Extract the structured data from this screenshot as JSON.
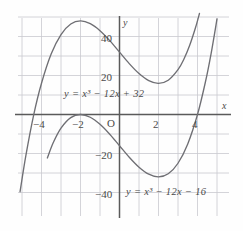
{
  "figure": {
    "type": "cartesian-graph",
    "axis_labels": {
      "x": "x",
      "y": "y",
      "origin": "O"
    },
    "x_ticks": [
      {
        "value": -4,
        "label": "−4"
      },
      {
        "value": -2,
        "label": "−2"
      },
      {
        "value": 2,
        "label": "2"
      },
      {
        "value": 4,
        "label": "4"
      }
    ],
    "y_ticks": [
      {
        "value": 40,
        "label": "40"
      },
      {
        "value": 20,
        "label": "20"
      },
      {
        "value": -20,
        "label": "−20"
      },
      {
        "value": -40,
        "label": "−40"
      }
    ],
    "curve_labels": {
      "upper": "y = x³ − 12x + 32",
      "lower": "y = x³ − 12x − 16"
    },
    "colors": {
      "grid": "#c9c9cf",
      "axis": "#5a5a5a",
      "curve": "#6f6f74",
      "text": "#4a4a4a",
      "background": "#fefefe"
    }
  },
  "chart_data": {
    "type": "line",
    "title": "",
    "xlabel": "x",
    "ylabel": "y",
    "xlim": [
      -5.2,
      5.6
    ],
    "ylim": [
      -49,
      50
    ],
    "grid": true,
    "legend": "inline-annotations",
    "x_ticks": [
      -4,
      -2,
      2,
      4
    ],
    "y_ticks": [
      40,
      20,
      -20,
      -40
    ],
    "x_gridline_step": 1,
    "y_gridline_step": 10,
    "series": [
      {
        "name": "y = x³ − 12x + 32",
        "equation": "x^3 - 12x + 32",
        "roots": [
          -4,
          2
        ],
        "local_max": {
          "x": -2,
          "y": 48
        },
        "local_min": {
          "x": 2,
          "y": 16
        },
        "points": [
          {
            "x": -5.1,
            "y": -39.6
          },
          {
            "x": -4.8,
            "y": -21.0
          },
          {
            "x": -4.4,
            "y": -0.2
          },
          {
            "x": -4.0,
            "y": 16.0
          },
          {
            "x": -3.5,
            "y": 31.1
          },
          {
            "x": -3.0,
            "y": 41.0
          },
          {
            "x": -2.5,
            "y": 46.4
          },
          {
            "x": -2.0,
            "y": 48.0
          },
          {
            "x": -1.5,
            "y": 46.6
          },
          {
            "x": -1.0,
            "y": 43.0
          },
          {
            "x": -0.5,
            "y": 37.9
          },
          {
            "x": 0.0,
            "y": 32.0
          },
          {
            "x": 0.5,
            "y": 26.1
          },
          {
            "x": 1.0,
            "y": 21.0
          },
          {
            "x": 1.5,
            "y": 17.4
          },
          {
            "x": 2.0,
            "y": 16.0
          },
          {
            "x": 2.5,
            "y": 17.6
          },
          {
            "x": 3.0,
            "y": 23.0
          },
          {
            "x": 3.3,
            "y": 28.3
          },
          {
            "x": 3.6,
            "y": 35.5
          },
          {
            "x": 3.9,
            "y": 44.6
          },
          {
            "x": 4.1,
            "y": 51.8
          }
        ]
      },
      {
        "name": "y = x³ − 12x − 16",
        "equation": "x^3 - 12x - 16",
        "roots": [
          -2,
          4
        ],
        "local_max": {
          "x": -2,
          "y": 0
        },
        "local_min": {
          "x": 2,
          "y": -32
        },
        "points": [
          {
            "x": -3.7,
            "y": -22.3
          },
          {
            "x": -3.4,
            "y": -14.5
          },
          {
            "x": -3.0,
            "y": -7.0
          },
          {
            "x": -2.5,
            "y": -1.6
          },
          {
            "x": -2.0,
            "y": 0.0
          },
          {
            "x": -1.5,
            "y": -1.4
          },
          {
            "x": -1.0,
            "y": -5.0
          },
          {
            "x": -0.5,
            "y": -10.1
          },
          {
            "x": 0.0,
            "y": -16.0
          },
          {
            "x": 0.5,
            "y": -21.9
          },
          {
            "x": 1.0,
            "y": -27.0
          },
          {
            "x": 1.5,
            "y": -30.6
          },
          {
            "x": 2.0,
            "y": -32.0
          },
          {
            "x": 2.5,
            "y": -30.4
          },
          {
            "x": 3.0,
            "y": -25.0
          },
          {
            "x": 3.5,
            "y": -15.1
          },
          {
            "x": 4.0,
            "y": 0.0
          },
          {
            "x": 4.4,
            "y": 16.4
          },
          {
            "x": 4.7,
            "y": 31.4
          },
          {
            "x": 5.0,
            "y": 49.0
          }
        ]
      }
    ],
    "annotations": [
      {
        "text": "y = x³ − 12x + 32",
        "x": 0.2,
        "y": 10
      },
      {
        "text": "y = x³ − 12x − 16",
        "x": 1.1,
        "y": -39
      }
    ]
  }
}
